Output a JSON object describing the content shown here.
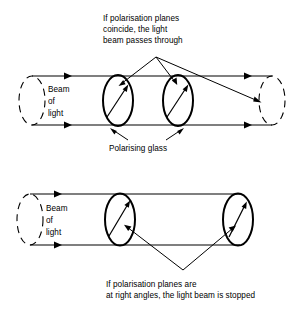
{
  "figure": {
    "stroke_color": "#000000",
    "background_color": "#ffffff",
    "panels": [
      {
        "id": "top-panel",
        "name": "polarisation-planes-coincide",
        "caption": {
          "lines": [
            "If polarisation planes",
            "coincide, the light",
            "beam passes through"
          ],
          "position": "above"
        },
        "beam_label": {
          "lines": [
            "Beam",
            "of",
            "light"
          ]
        },
        "parts_label": "Polarising glass",
        "outcome": "passes through",
        "filters": [
          {
            "name": "polarising-glass-1",
            "center_x": 118,
            "arrow_angle_deg": 52
          },
          {
            "name": "polarising-glass-2",
            "center_x": 178,
            "arrow_angle_deg": 52
          }
        ],
        "beam_arrow_count": 4
      },
      {
        "id": "bottom-panel",
        "name": "polarisation-planes-at-right-angles",
        "caption": {
          "lines": [
            "If polarisation planes are",
            "at right angles, the light beam is stopped"
          ],
          "position": "below"
        },
        "beam_label": {
          "lines": [
            "Beam",
            "of",
            "light"
          ]
        },
        "outcome": "stopped",
        "filters": [
          {
            "name": "polarising-glass-3",
            "center_x": 120,
            "arrow_angle_deg": 58
          },
          {
            "name": "polarising-glass-4",
            "center_x": 238,
            "arrow_angle_deg": 62
          }
        ],
        "beam_arrow_count": 2
      }
    ]
  }
}
